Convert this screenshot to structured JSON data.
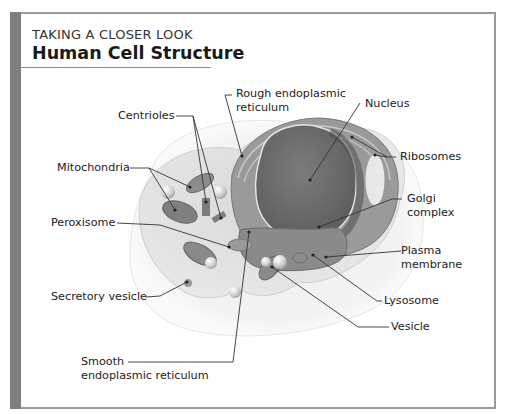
{
  "header": {
    "kicker": "TAKING A CLOSER LOOK",
    "title": "Human Cell Structure"
  },
  "labels": {
    "rough_er": [
      "Rough endoplasmic",
      "reticulum"
    ],
    "nucleus": "Nucleus",
    "centrioles": "Centrioles",
    "ribosomes": "Ribosomes",
    "mitochondria": "Mitochondria",
    "golgi": [
      "Golgi",
      "complex"
    ],
    "peroxisome": "Peroxisome",
    "plasma_membrane": [
      "Plasma",
      "membrane"
    ],
    "lysosome": "Lysosome",
    "secretory_vesicle": "Secretory vesicle",
    "vesicle": "Vesicle",
    "smooth_er": [
      "Smooth",
      "endoplasmic reticulum"
    ]
  },
  "colors": {
    "frame_bar": "#7e7e7e",
    "frame_border": "#9a9a9a",
    "cytoplasm": "#e4e4e4",
    "membrane_halo": "#f1f1f1",
    "nucleus": "#6f6f6f",
    "organelle": "#8a8a8a",
    "leader": "#333333"
  }
}
